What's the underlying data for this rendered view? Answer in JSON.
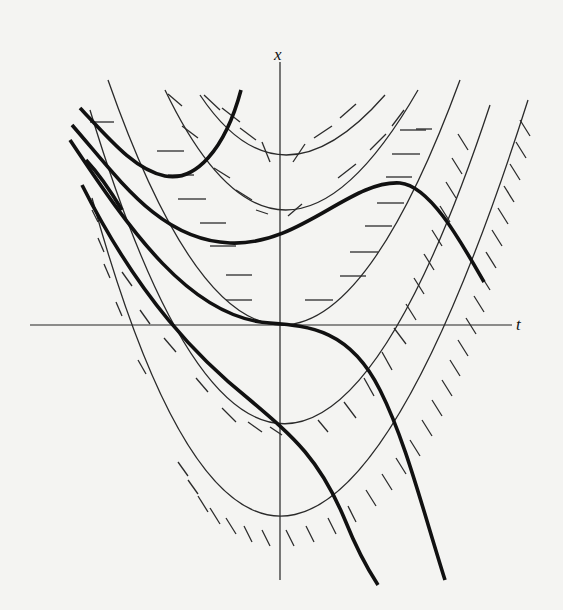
{
  "figure": {
    "type": "slope-field-isoclines",
    "axes": {
      "horizontal_label": "t",
      "vertical_label": "x",
      "origin_px": [
        280,
        325
      ]
    },
    "colors": {
      "background": "#f4f4f2",
      "ink": "#111111"
    },
    "isoclines": [
      {
        "name": "isocline-top",
        "vertex_px": [
          280,
          157
        ],
        "tick_style": "steep-positive-left-negative"
      },
      {
        "name": "isocline-upper",
        "vertex_px": [
          280,
          211
        ],
        "tick_style": "moderate"
      },
      {
        "name": "isocline-zero",
        "vertex_px": [
          280,
          325
        ],
        "tick_style": "horizontal"
      },
      {
        "name": "isocline-lower",
        "vertex_px": [
          280,
          428
        ],
        "tick_style": "moderate"
      },
      {
        "name": "isocline-bottom",
        "vertex_px": [
          280,
          536
        ],
        "tick_style": "steep"
      }
    ],
    "solution_curves": [
      {
        "name": "solution-cup-top-left"
      },
      {
        "name": "solution-s-curve-upper"
      },
      {
        "name": "solution-through-origin"
      },
      {
        "name": "solution-descending-middle"
      },
      {
        "name": "solution-descending-lower"
      }
    ]
  }
}
